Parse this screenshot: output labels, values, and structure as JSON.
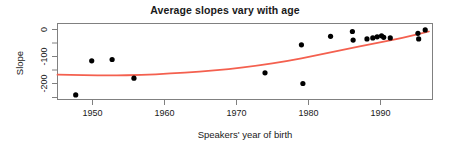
{
  "chart_data": {
    "type": "scatter",
    "title": "Average slopes vary with age",
    "xlabel": "Speakers' year of birth",
    "ylabel": "Slope",
    "xlim": [
      1944.5,
      1996.0
    ],
    "ylim": [
      -245,
      40
    ],
    "grid": false,
    "legend": null,
    "xticks": [
      1950,
      1960,
      1970,
      1980,
      1990
    ],
    "xtick_labels": [
      "1950",
      "1960",
      "1970",
      "1980",
      "1990"
    ],
    "yticks": [
      0,
      -100,
      -200
    ],
    "ytick_labels": [
      "0",
      "-100",
      "-200"
    ],
    "point_color": "#000000",
    "smoother_color": "#f4604f",
    "frame_color": "#808080",
    "series": [
      {
        "name": "Speaker average slope",
        "marker": "filled-circle",
        "x": [
          1947.0,
          1949.2,
          1952.0,
          1955.0,
          1973.0,
          1978.0,
          1978.2,
          1982.0,
          1985.0,
          1985.1,
          1987.0,
          1987.8,
          1988.4,
          1989.0,
          1989.3,
          1990.2,
          1994.0,
          1994.1,
          1995.0
        ],
        "y": [
          -228,
          -100,
          -95,
          -165,
          -145,
          -40,
          -185,
          -8,
          10,
          -22,
          -18,
          -14,
          -10,
          -6,
          -12,
          -14,
          3,
          -18,
          16
        ]
      },
      {
        "name": "LOESS smoother",
        "marker": "line",
        "x": [
          1944.5,
          1948.0,
          1952.0,
          1956.0,
          1960.0,
          1964.0,
          1968.0,
          1972.0,
          1976.0,
          1980.0,
          1984.0,
          1988.0,
          1992.0,
          1995.5
        ],
        "y": [
          -152,
          -154,
          -155,
          -153,
          -148,
          -141,
          -131,
          -118,
          -101,
          -80,
          -57,
          -35,
          -14,
          10
        ]
      }
    ]
  },
  "figure": {
    "title": "Average slopes vary with age",
    "x_axis_title": "Speakers' year of birth",
    "y_axis_title": "Slope"
  }
}
